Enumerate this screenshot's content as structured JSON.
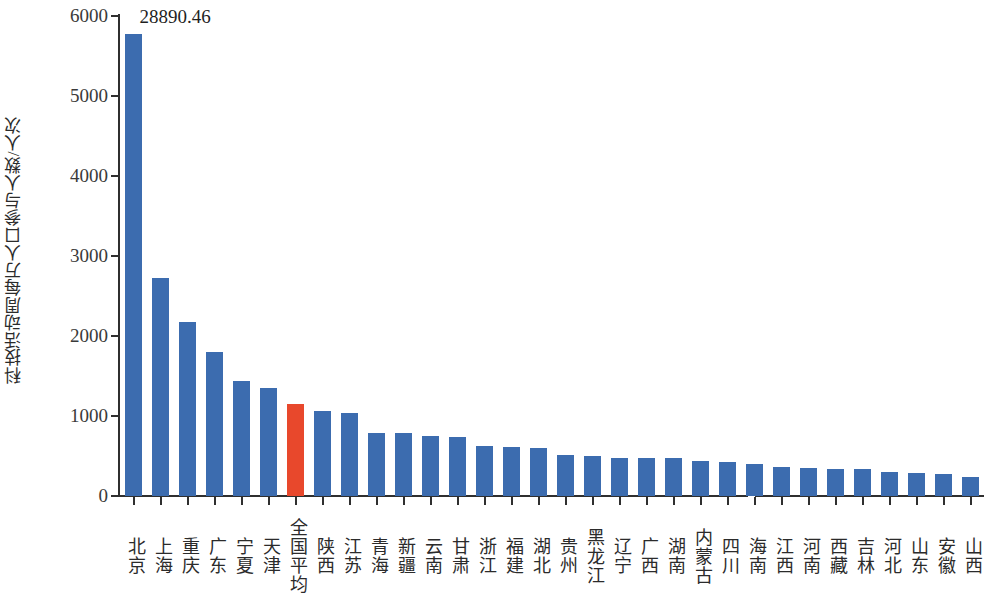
{
  "chart_data": {
    "type": "bar",
    "title": "",
    "xlabel": "",
    "ylabel": "科技活动周每万人口参与人数/人次",
    "ylim": [
      0,
      6000
    ],
    "ytick_labels": [
      "0",
      "1000",
      "2000",
      "3000",
      "4000",
      "5000",
      "6000"
    ],
    "ytick_values": [
      0,
      1000,
      2000,
      3000,
      4000,
      5000,
      6000
    ],
    "grid": false,
    "legend": "none",
    "axis_break_note": "y-axis is truncated at 6000; the first bar (北京) actual value is annotated above the plot",
    "categories": [
      "北京",
      "上海",
      "重庆",
      "广东",
      "宁夏",
      "天津",
      "全国平均",
      "陕西",
      "江苏",
      "青海",
      "新疆",
      "云南",
      "甘肃",
      "浙江",
      "福建",
      "湖北",
      "贵州",
      "黑龙江",
      "辽宁",
      "广西",
      "湖南",
      "内蒙古",
      "四川",
      "海南",
      "江西",
      "河南",
      "西藏",
      "吉林",
      "河北",
      "山东",
      "安徽",
      "山西"
    ],
    "values": [
      5780,
      2730,
      2175,
      1800,
      1440,
      1350,
      1145,
      1065,
      1035,
      785,
      790,
      750,
      740,
      625,
      615,
      605,
      515,
      495,
      475,
      475,
      470,
      440,
      425,
      405,
      365,
      350,
      340,
      335,
      305,
      285,
      270,
      240
    ],
    "bar_colors": [
      "#3C6CAF",
      "#3C6CAF",
      "#3C6CAF",
      "#3C6CAF",
      "#3C6CAF",
      "#3C6CAF",
      "#E8482C",
      "#3C6CAF",
      "#3C6CAF",
      "#3C6CAF",
      "#3C6CAF",
      "#3C6CAF",
      "#3C6CAF",
      "#3C6CAF",
      "#3C6CAF",
      "#3C6CAF",
      "#3C6CAF",
      "#3C6CAF",
      "#3C6CAF",
      "#3C6CAF",
      "#3C6CAF",
      "#3C6CAF",
      "#3C6CAF",
      "#3C6CAF",
      "#3C6CAF",
      "#3C6CAF",
      "#3C6CAF",
      "#3C6CAF",
      "#3C6CAF",
      "#3C6CAF",
      "#3C6CAF",
      "#3C6CAF"
    ],
    "annotations": [
      {
        "text": "28890.46",
        "category": "北京",
        "note": "actual value of first bar, shown above truncated bar"
      }
    ],
    "series_color_default": "#3C6CAF",
    "series_color_highlight": "#E8482C"
  },
  "colors": {
    "bar_blue": "#3C6CAF",
    "bar_red": "#E8482C",
    "axis": "#2f2f2f",
    "text": "#2b2b2b",
    "background": "#ffffff"
  }
}
